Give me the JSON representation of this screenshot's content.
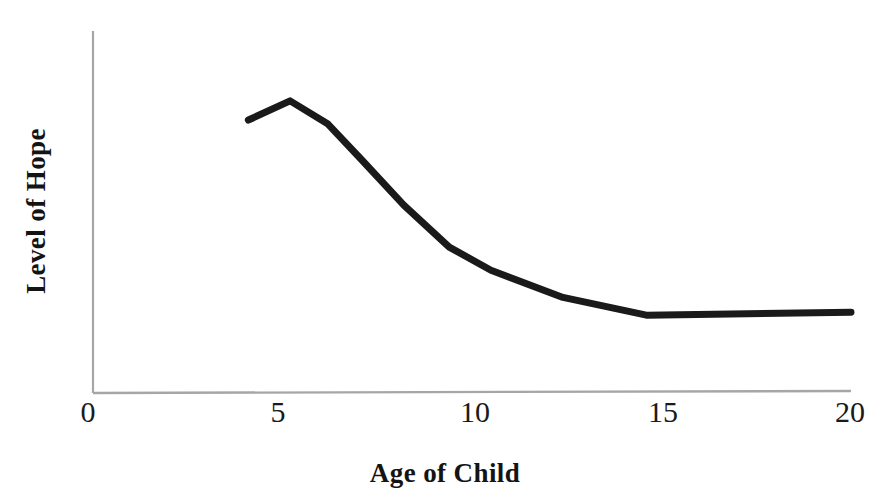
{
  "chart_data": {
    "type": "line",
    "title": "",
    "xlabel": "Age of Child",
    "ylabel": "Level of Hope",
    "xlim": [
      0,
      20
    ],
    "ylim": [
      0,
      100
    ],
    "grid": false,
    "legend": null,
    "x_ticks": [
      "0",
      "5",
      "10",
      "15",
      "20"
    ],
    "x_tick_values": [
      0,
      5,
      10,
      15,
      20
    ],
    "y_ticks": [],
    "axis_color": "#a6a6a6",
    "line_color": "#1a1a1a",
    "line_width": 7,
    "series": [
      {
        "name": "Level of Hope",
        "x": [
          4.1,
          5.2,
          6.2,
          7.1,
          8.2,
          9.4,
          10.5,
          12.4,
          14.6,
          20.0
        ],
        "values": [
          75.4,
          80.7,
          74.3,
          64.3,
          51.9,
          40.3,
          33.9,
          26.4,
          21.5,
          22.3
        ]
      }
    ]
  },
  "axes": {
    "x_tick_labels": [
      "0",
      "5",
      "10",
      "15",
      "20"
    ],
    "x_axis_title": "Age of Child",
    "y_axis_title": "Level of Hope"
  }
}
